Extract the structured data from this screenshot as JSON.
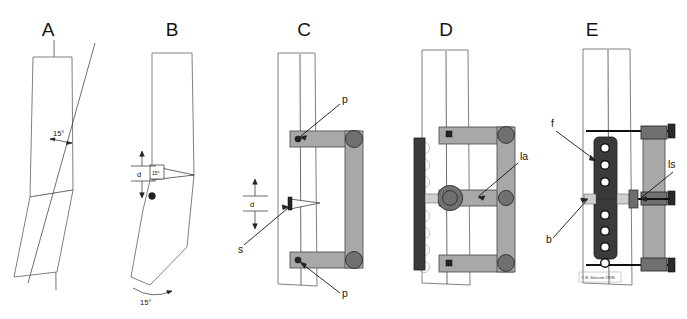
{
  "figure": {
    "title_visible": false,
    "credit": "© B. Slocum 1996",
    "panels": [
      {
        "id": "A",
        "letter": "A",
        "name": "tibial-plateau-angle-preop",
        "annotations": [
          {
            "key": "angle",
            "text": "15°",
            "kind": "angle-dimension"
          }
        ]
      },
      {
        "id": "B",
        "letter": "B",
        "name": "closing-wedge-osteotomy",
        "annotations": [
          {
            "key": "d",
            "text": "d",
            "kind": "linear-dimension"
          },
          {
            "key": "wedge_angle",
            "text": "15°",
            "kind": "wedge-angle"
          },
          {
            "key": "rotation",
            "text": "15°",
            "kind": "rotation-arc"
          }
        ]
      },
      {
        "id": "C",
        "letter": "C",
        "name": "external-fixator-pins-applied",
        "annotations": [
          {
            "key": "p_top",
            "text": "p",
            "kind": "leader-label"
          },
          {
            "key": "p_bottom",
            "text": "p",
            "kind": "leader-label"
          },
          {
            "key": "d",
            "text": "d",
            "kind": "linear-dimension"
          },
          {
            "key": "s",
            "text": "s",
            "kind": "leader-label"
          }
        ]
      },
      {
        "id": "D",
        "letter": "D",
        "name": "fixator-with-adjustable-arm",
        "annotations": [
          {
            "key": "la",
            "text": "la",
            "kind": "leader-label"
          }
        ]
      },
      {
        "id": "E",
        "letter": "E",
        "name": "bone-plate-and-screws-applied",
        "annotations": [
          {
            "key": "f",
            "text": "f",
            "kind": "leader-label"
          },
          {
            "key": "b",
            "text": "b",
            "kind": "leader-label"
          },
          {
            "key": "ls",
            "text": "ls",
            "kind": "leader-label"
          }
        ],
        "plate_hole_count": 7
      }
    ],
    "colors": {
      "background": "#ffffff",
      "bone_outline": "#5f5f5f",
      "fixator_bar": "#a8a8a8",
      "clamp": "#707070",
      "plate_dark": "#3a3a3a",
      "hole_fill": "#ffffff",
      "label_text": "#141414"
    }
  }
}
